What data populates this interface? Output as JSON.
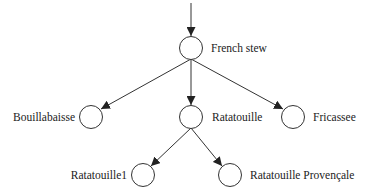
{
  "diagram": {
    "type": "tree",
    "colors": {
      "line": "#333333",
      "text": "#222222",
      "background": "#ffffff"
    },
    "nodes": [
      {
        "id": "french_stew",
        "label": "French stew",
        "label_side": "right"
      },
      {
        "id": "bouillabaisse",
        "label": "Bouillabaisse",
        "label_side": "left"
      },
      {
        "id": "ratatouille",
        "label": "Ratatouille",
        "label_side": "right"
      },
      {
        "id": "fricassee",
        "label": "Fricassee",
        "label_side": "right"
      },
      {
        "id": "ratatouille1",
        "label": "Ratatouille1",
        "label_side": "left"
      },
      {
        "id": "ratatouille_provencale",
        "label": "Ratatouille Provençale",
        "label_side": "right"
      }
    ],
    "edges": [
      {
        "from": "(entry)",
        "to": "french_stew"
      },
      {
        "from": "french_stew",
        "to": "bouillabaisse"
      },
      {
        "from": "french_stew",
        "to": "ratatouille"
      },
      {
        "from": "french_stew",
        "to": "fricassee"
      },
      {
        "from": "ratatouille",
        "to": "ratatouille1"
      },
      {
        "from": "ratatouille",
        "to": "ratatouille_provencale"
      }
    ]
  }
}
